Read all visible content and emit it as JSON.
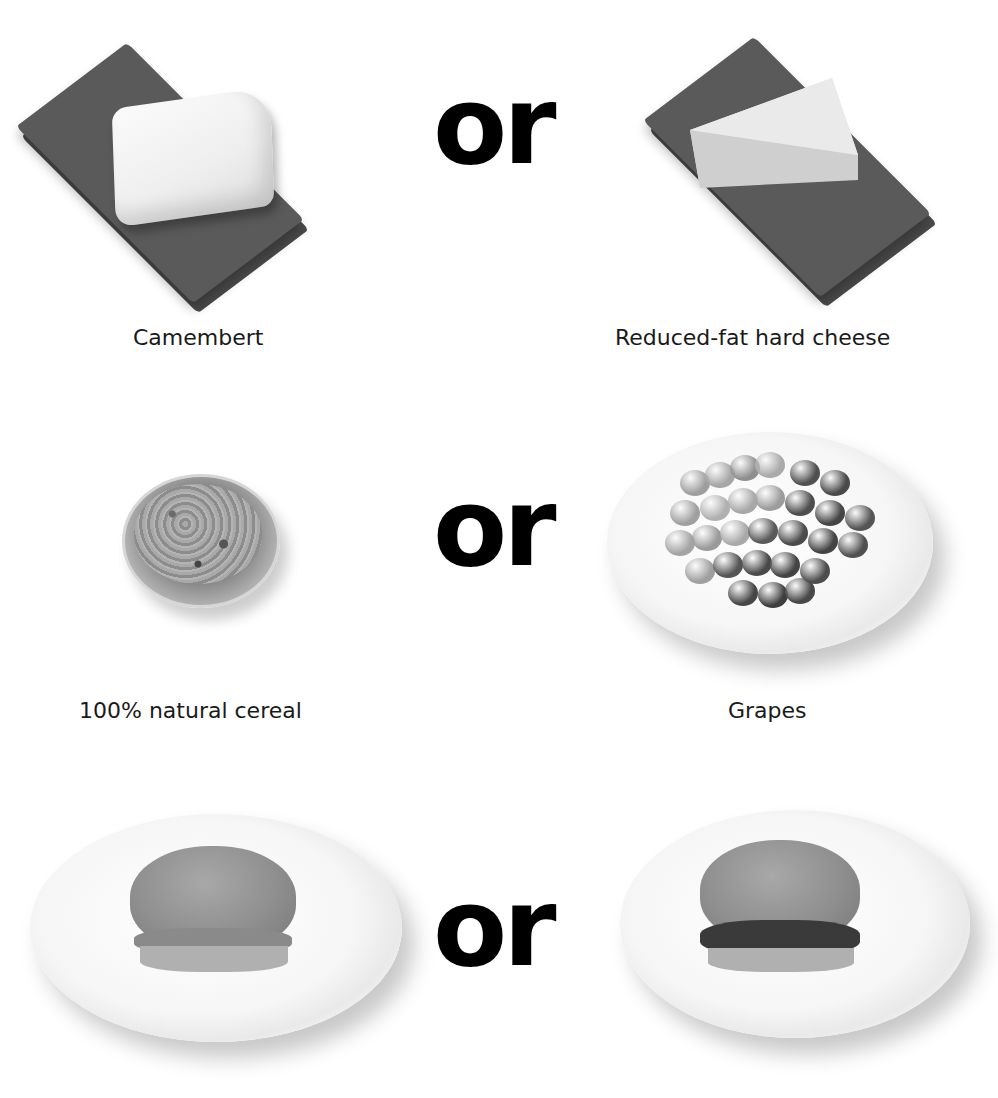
{
  "comparisons": [
    {
      "left": {
        "label": "Camembert",
        "image": "camembert-on-napkin"
      },
      "separator": "or",
      "right": {
        "label": "Reduced-fat hard cheese",
        "image": "hard-cheese-wedge-on-napkin"
      }
    },
    {
      "left": {
        "label": "100% natural cereal",
        "image": "cereal-in-glass-bowl"
      },
      "separator": "or",
      "right": {
        "label": "Grapes",
        "image": "grapes-on-plate"
      }
    },
    {
      "left": {
        "label": "",
        "image": "chicken-burger-on-plate"
      },
      "separator": "or",
      "right": {
        "label": "",
        "image": "beef-burger-on-plate"
      }
    }
  ]
}
